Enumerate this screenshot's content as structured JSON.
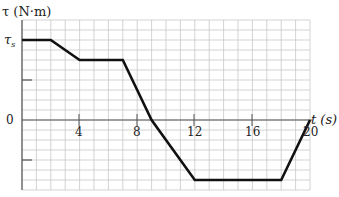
{
  "chart_data": {
    "type": "line",
    "title": "",
    "xlabel": "t (s)",
    "ylabel": "τ (N·m)",
    "x_ticks": [
      "4",
      "8",
      "12",
      "16",
      "20"
    ],
    "y_ticks": [
      "τs",
      "0"
    ],
    "xlim": [
      0,
      20
    ],
    "ylim_in_units_of_tau_s": [
      -0.9,
      1.15
    ],
    "grid": true,
    "series": [
      {
        "name": "torque",
        "x": [
          0,
          2,
          4,
          7,
          9,
          12,
          18,
          20
        ],
        "y_in_units_of_tau_s": [
          1.0,
          1.0,
          0.75,
          0.75,
          0.0,
          -0.75,
          -0.75,
          0.0
        ]
      }
    ]
  },
  "labels": {
    "y_axis": "τ (N·m)",
    "x_axis": "t (s)",
    "tau_s_main": "τ",
    "tau_s_sub": "s",
    "zero": "0",
    "tick4": "4",
    "tick8": "8",
    "tick12": "12",
    "tick16": "16",
    "tick20": "20"
  },
  "colors": {
    "grid": "#c8c8c8",
    "axis": "#555555",
    "line": "#111111"
  }
}
